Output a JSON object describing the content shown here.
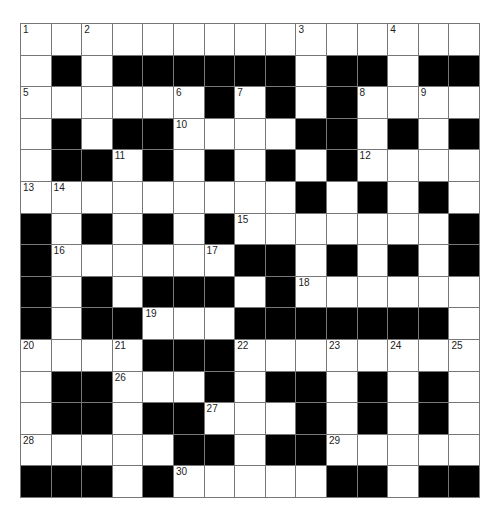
{
  "puzzle": {
    "type": "crossword",
    "rows": 15,
    "cols": 15,
    "colors": {
      "block": "#000000",
      "cell": "#ffffff",
      "line": "#777777"
    },
    "layout": [
      "...............",
      ".#.######.##.##",
      "......#.#.#....",
      ".#.##....##.#.#",
      ".##.#.#.#.#....",
      ".........#.#.#.",
      "#.#.#.#.......#",
      "#......##.#.#.#",
      "#.#.###.#......",
      "#.##...#######.#",
      "....###........",
      ".##...#.##.#.#.",
      ".##.##...#.#.#.",
      ".....##.##.....",
      "###.#.....##.##"
    ],
    "numbers": [
      {
        "r": 0,
        "c": 0,
        "n": "1"
      },
      {
        "r": 0,
        "c": 2,
        "n": "2"
      },
      {
        "r": 0,
        "c": 9,
        "n": "3"
      },
      {
        "r": 0,
        "c": 12,
        "n": "4"
      },
      {
        "r": 2,
        "c": 0,
        "n": "5"
      },
      {
        "r": 2,
        "c": 5,
        "n": "6"
      },
      {
        "r": 2,
        "c": 7,
        "n": "7"
      },
      {
        "r": 2,
        "c": 11,
        "n": "8"
      },
      {
        "r": 2,
        "c": 13,
        "n": "9"
      },
      {
        "r": 3,
        "c": 5,
        "n": "10"
      },
      {
        "r": 4,
        "c": 3,
        "n": "11"
      },
      {
        "r": 4,
        "c": 11,
        "n": "12"
      },
      {
        "r": 5,
        "c": 0,
        "n": "13"
      },
      {
        "r": 5,
        "c": 1,
        "n": "14"
      },
      {
        "r": 6,
        "c": 7,
        "n": "15"
      },
      {
        "r": 7,
        "c": 1,
        "n": "16"
      },
      {
        "r": 7,
        "c": 6,
        "n": "17"
      },
      {
        "r": 8,
        "c": 9,
        "n": "18"
      },
      {
        "r": 9,
        "c": 4,
        "n": "19"
      },
      {
        "r": 10,
        "c": 0,
        "n": "20"
      },
      {
        "r": 10,
        "c": 3,
        "n": "21"
      },
      {
        "r": 10,
        "c": 7,
        "n": "22"
      },
      {
        "r": 10,
        "c": 10,
        "n": "23"
      },
      {
        "r": 10,
        "c": 12,
        "n": "24"
      },
      {
        "r": 10,
        "c": 14,
        "n": "25"
      },
      {
        "r": 11,
        "c": 3,
        "n": "26"
      },
      {
        "r": 12,
        "c": 6,
        "n": "27"
      },
      {
        "r": 13,
        "c": 0,
        "n": "28"
      },
      {
        "r": 13,
        "c": 10,
        "n": "29"
      },
      {
        "r": 14,
        "c": 5,
        "n": "30"
      }
    ]
  }
}
